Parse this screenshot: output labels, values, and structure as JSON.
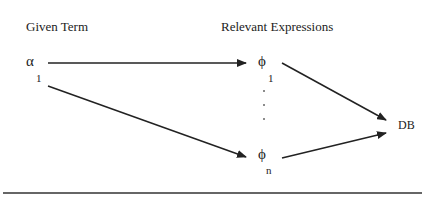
{
  "headers": {
    "given_term": "Given Term",
    "relevant_expressions": "Relevant Expressions"
  },
  "nodes": {
    "alpha": {
      "symbol": "α",
      "subscript": "1"
    },
    "phi_1": {
      "symbol": "ϕ",
      "subscript": "1"
    },
    "phi_n": {
      "symbol": "ϕ",
      "subscript": "n"
    },
    "db": {
      "label": "DB"
    }
  },
  "edges": [
    {
      "from": "alpha_1",
      "to": "phi_1"
    },
    {
      "from": "alpha_1",
      "to": "phi_n"
    },
    {
      "from": "phi_1",
      "to": "DB"
    },
    {
      "from": "phi_n",
      "to": "DB"
    }
  ],
  "ellipsis": "· · ·",
  "colors": {
    "ink": "#222222",
    "background": "#ffffff"
  }
}
